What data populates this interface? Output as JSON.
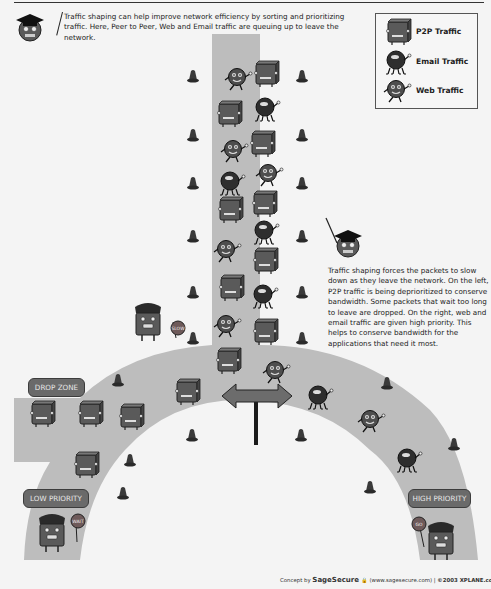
{
  "header": {
    "intro_text": "Traffic shaping can help improve network efficiency by sorting and prioritizing traffic. Here, Peer to Peer, Web and Email traffic are queuing up to leave the network."
  },
  "legend": {
    "items": [
      {
        "icon": "p2p-box-icon",
        "label": "P2P Traffic"
      },
      {
        "icon": "email-ball-icon",
        "label": "Email Traffic"
      },
      {
        "icon": "web-ball-icon",
        "label": "Web Traffic"
      }
    ]
  },
  "explanation": {
    "text": "Traffic shaping forces the packets to slow down as they leave the network. On the left, P2P traffic is being deprioritized to conserve bandwidth. Some packets that wait too long to leave are dropped. On the right, web and email traffic are given high priority. This helps to conserve bandwidth for the applications that need it most."
  },
  "zones": {
    "drop_zone": "DROP ZONE",
    "low_priority": "LOW PRIORITY",
    "high_priority": "HIGH PRIORITY"
  },
  "signs": {
    "slow": "SLOW",
    "wait": "WAIT",
    "go": "GO"
  },
  "footer": {
    "concept_by": "Concept by",
    "brand": "SageSecure",
    "url": "(www.sagesecure.com)",
    "separator": "|",
    "copyright": "©2003 XPLANE.com®"
  },
  "colors": {
    "road": "#bdbdbd",
    "background": "#f4f4f4",
    "pill": "#6a6a6a",
    "sign": "#6e5a5a",
    "character_dark": "#3a3a3a"
  }
}
